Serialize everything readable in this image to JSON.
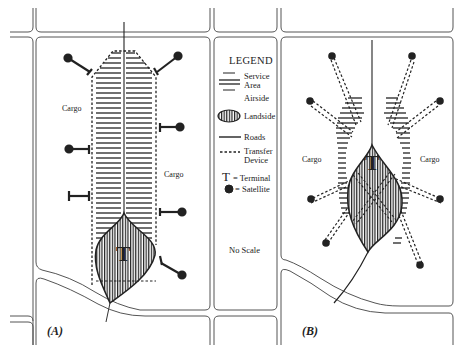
{
  "legend": {
    "title": "LEGEND",
    "items": [
      {
        "symbol": "service-area-hatch",
        "label_line1": "Service",
        "label_line2": "Area"
      },
      {
        "symbol": "none",
        "label_line1": "Airside",
        "label_line2": ""
      },
      {
        "symbol": "landside-vertical-hatch",
        "label_line1": "Landside",
        "label_line2": ""
      },
      {
        "symbol": "solid-line",
        "label_line1": "Roads",
        "label_line2": ""
      },
      {
        "symbol": "dashed-line",
        "label_line1": "Transfer",
        "label_line2": "Device"
      },
      {
        "symbol": "T",
        "label_line1": "= Terminal",
        "label_line2": ""
      },
      {
        "symbol": "filled-circle",
        "label_line1": "= Satellite",
        "label_line2": ""
      }
    ],
    "terminal_glyph": "T",
    "no_scale": "No Scale"
  },
  "panel_a": {
    "label": "(A)",
    "cargo_left": "Cargo",
    "cargo_right": "Cargo",
    "terminal": "T"
  },
  "panel_b": {
    "label": "(B)",
    "cargo_left": "Cargo",
    "cargo_right": "Cargo",
    "terminal": "T"
  },
  "colors": {
    "line": "#333333",
    "road": "#555555",
    "background": "#ffffff"
  }
}
